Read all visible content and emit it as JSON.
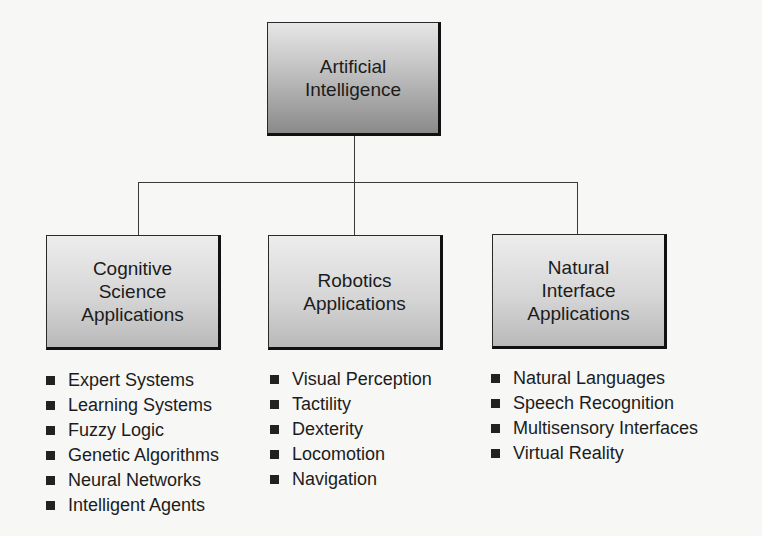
{
  "diagram": {
    "root": {
      "label": "Artificial\nIntelligence"
    },
    "branches": [
      {
        "label": "Cognitive\nScience\nApplications",
        "items": [
          "Expert Systems",
          "Learning Systems",
          "Fuzzy Logic",
          "Genetic Algorithms",
          "Neural Networks",
          "Intelligent Agents"
        ]
      },
      {
        "label": "Robotics\nApplications",
        "items": [
          "Visual Perception",
          "Tactility",
          "Dexterity",
          "Locomotion",
          "Navigation"
        ]
      },
      {
        "label": "Natural\nInterface\nApplications",
        "items": [
          "Natural Languages",
          "Speech Recognition",
          "Multisensory Interfaces",
          "Virtual Reality"
        ]
      }
    ],
    "icons": {
      "bullet": "square-bullet-icon"
    }
  }
}
